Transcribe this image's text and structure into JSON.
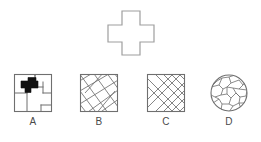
{
  "page": {
    "type": "embedded-figure-puzzle",
    "background_color": "#ffffff",
    "stroke_color": "#7a7a7a",
    "label_color": "#4a4a4a",
    "fill_color": "#111111"
  },
  "target": {
    "name": "cross-shape",
    "description": "plus / cross outline",
    "stroke_color": "#9a9a9a",
    "fill": "#ffffff"
  },
  "options": [
    {
      "id": "a",
      "label": "A",
      "shape": "square",
      "pattern": "rectilinear-blocks-with-filled-cross",
      "contains_target": true,
      "highlight_color": "#111111"
    },
    {
      "id": "b",
      "label": "B",
      "shape": "square",
      "pattern": "irregular-diagonal-hatch",
      "contains_target": false,
      "highlight_color": "#7a7a7a"
    },
    {
      "id": "c",
      "label": "C",
      "shape": "square",
      "pattern": "regular-crosshatch",
      "contains_target": false,
      "highlight_color": "#7a7a7a"
    },
    {
      "id": "d",
      "label": "D",
      "shape": "circle",
      "pattern": "irregular-crack-cells",
      "contains_target": false,
      "highlight_color": "#7a7a7a"
    }
  ]
}
